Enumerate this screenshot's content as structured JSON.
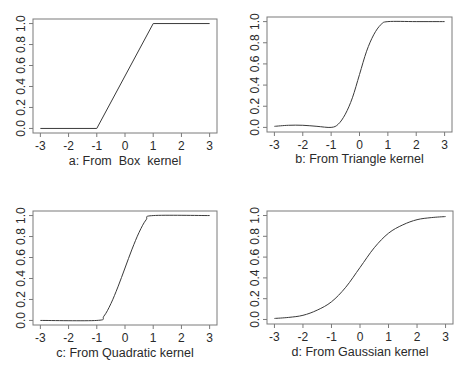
{
  "chart_data": [
    {
      "id": "a",
      "type": "line",
      "title": "",
      "xlabel": "a: From  Box  kernel",
      "ylabel": "",
      "xlim": [
        -3,
        3
      ],
      "ylim": [
        0,
        1
      ],
      "xticks": [
        "-3",
        "-2",
        "-1",
        "0",
        "1",
        "2",
        "3"
      ],
      "yticks": [
        "0.0",
        "0.2",
        "0.4",
        "0.6",
        "0.8",
        "1.0"
      ],
      "grid": false,
      "x": [
        -3,
        -1,
        1,
        3
      ],
      "y": [
        0.0,
        0.0,
        1.0,
        1.0
      ]
    },
    {
      "id": "b",
      "type": "line",
      "title": "",
      "xlabel": "b: From Triangle kernel",
      "ylabel": "",
      "xlim": [
        -3,
        3
      ],
      "ylim": [
        0,
        1
      ],
      "xticks": [
        "-3",
        "-2",
        "-1",
        "0",
        "1",
        "2",
        "3"
      ],
      "yticks": [
        "0.0",
        "0.2",
        "0.4",
        "0.6",
        "0.8",
        "1.0"
      ],
      "grid": false,
      "x": [
        -3,
        -2.5,
        -2,
        -1.5,
        -1,
        -0.75,
        -0.5,
        -0.25,
        0,
        0.25,
        0.5,
        0.75,
        1,
        2,
        3
      ],
      "y": [
        0.01,
        0.02,
        0.02,
        0.01,
        0.0,
        0.03,
        0.125,
        0.28,
        0.5,
        0.72,
        0.875,
        0.97,
        1.0,
        1.0,
        1.0
      ]
    },
    {
      "id": "c",
      "type": "line",
      "title": "",
      "xlabel": "c: From Quadratic kernel",
      "ylabel": "",
      "xlim": [
        -3,
        3
      ],
      "ylim": [
        0,
        1
      ],
      "xticks": [
        "-3",
        "-2",
        "-1",
        "0",
        "1",
        "2",
        "3"
      ],
      "yticks": [
        "0.0",
        "0.2",
        "0.4",
        "0.6",
        "0.8",
        "1.0"
      ],
      "grid": false,
      "x": [
        -3,
        -1,
        -0.75,
        -0.5,
        -0.25,
        0,
        0.25,
        0.5,
        0.75,
        1,
        3
      ],
      "y": [
        0.0,
        0.0,
        0.04,
        0.16,
        0.32,
        0.5,
        0.68,
        0.84,
        0.96,
        1.0,
        1.0
      ]
    },
    {
      "id": "d",
      "type": "line",
      "title": "",
      "xlabel": "d: From Gaussian kernel",
      "ylabel": "",
      "xlim": [
        -3,
        3
      ],
      "ylim": [
        0,
        1
      ],
      "xticks": [
        "-3",
        "-2",
        "-1",
        "0",
        "1",
        "2",
        "3"
      ],
      "yticks": [
        "0.0",
        "0.2",
        "0.4",
        "0.6",
        "0.8",
        "1.0"
      ],
      "grid": false,
      "x": [
        -3,
        -2.5,
        -2,
        -1.5,
        -1,
        -0.5,
        0,
        0.5,
        1,
        1.5,
        2,
        2.5,
        3
      ],
      "y": [
        0.01,
        0.02,
        0.04,
        0.09,
        0.17,
        0.31,
        0.5,
        0.69,
        0.83,
        0.91,
        0.96,
        0.98,
        0.99
      ]
    }
  ]
}
